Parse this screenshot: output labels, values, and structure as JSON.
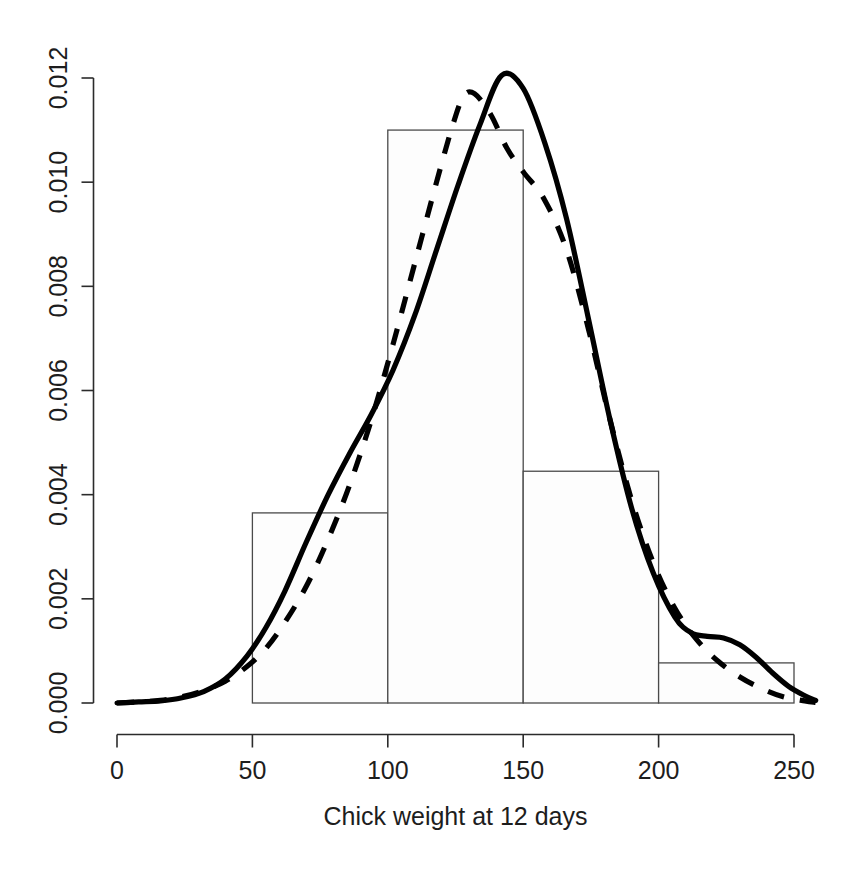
{
  "chart_data": {
    "type": "histogram",
    "title": "",
    "subtitle": "",
    "xlabel": "Chick weight at 12 days",
    "ylabel": "",
    "xlim": [
      0,
      255
    ],
    "ylim": [
      0.0,
      0.0125
    ],
    "grid": false,
    "legend": "none",
    "x_ticks": [
      0,
      50,
      100,
      150,
      200,
      250
    ],
    "x_tick_labels": [
      "0",
      "50",
      "100",
      "150",
      "200",
      "250"
    ],
    "y_ticks": [
      0.0,
      0.002,
      0.004,
      0.006,
      0.008,
      0.01,
      0.012
    ],
    "y_tick_labels": [
      "0.000",
      "0.002",
      "0.004",
      "0.006",
      "0.008",
      "0.010",
      "0.012"
    ],
    "y_tick_label_rotation": 90,
    "histogram": {
      "bin_width": 50,
      "bin_edges": [
        50,
        100,
        150,
        200,
        250
      ],
      "bins": [
        {
          "from": 50,
          "to": 100,
          "density": 0.00365
        },
        {
          "from": 100,
          "to": 150,
          "density": 0.011
        },
        {
          "from": 150,
          "to": 200,
          "density": 0.00445
        },
        {
          "from": 200,
          "to": 250,
          "density": 0.00077
        }
      ],
      "fill_color": "#fdfdfd",
      "border_color": "#4a4a4a"
    },
    "series": [
      {
        "name": "density-curve-solid",
        "style": "solid",
        "color": "#000000",
        "line_width": 5.2,
        "points": [
          [
            0,
            0.0
          ],
          [
            8,
            2e-05
          ],
          [
            16,
            4e-05
          ],
          [
            24,
            0.0001
          ],
          [
            32,
            0.00022
          ],
          [
            40,
            0.00046
          ],
          [
            48,
            0.0009
          ],
          [
            55,
            0.00145
          ],
          [
            62,
            0.00215
          ],
          [
            70,
            0.0031
          ],
          [
            78,
            0.004
          ],
          [
            86,
            0.0048
          ],
          [
            94,
            0.00555
          ],
          [
            102,
            0.0064
          ],
          [
            110,
            0.00745
          ],
          [
            118,
            0.0087
          ],
          [
            126,
            0.00995
          ],
          [
            134,
            0.0111
          ],
          [
            142,
            0.01205
          ],
          [
            150,
            0.0118
          ],
          [
            158,
            0.01075
          ],
          [
            166,
            0.0093
          ],
          [
            174,
            0.0074
          ],
          [
            182,
            0.00545
          ],
          [
            190,
            0.00375
          ],
          [
            198,
            0.0025
          ],
          [
            206,
            0.00165
          ],
          [
            212,
            0.00135
          ],
          [
            218,
            0.00128
          ],
          [
            224,
            0.00125
          ],
          [
            230,
            0.00112
          ],
          [
            236,
            0.00088
          ],
          [
            242,
            0.00058
          ],
          [
            248,
            0.00032
          ],
          [
            254,
            0.00014
          ],
          [
            258,
            5e-05
          ]
        ]
      },
      {
        "name": "density-curve-dashed",
        "style": "dashed",
        "color": "#000000",
        "line_width": 5.2,
        "dash_pattern": "17 16",
        "points": [
          [
            0,
            0.0
          ],
          [
            8,
            2e-05
          ],
          [
            16,
            5e-05
          ],
          [
            24,
            0.00012
          ],
          [
            32,
            0.00024
          ],
          [
            40,
            0.00042
          ],
          [
            48,
            0.0007
          ],
          [
            55,
            0.00105
          ],
          [
            62,
            0.00155
          ],
          [
            70,
            0.00225
          ],
          [
            78,
            0.00315
          ],
          [
            86,
            0.0042
          ],
          [
            94,
            0.00545
          ],
          [
            102,
            0.0069
          ],
          [
            110,
            0.00845
          ],
          [
            118,
            0.01
          ],
          [
            124,
            0.0111
          ],
          [
            128,
            0.01165
          ],
          [
            132,
            0.0117
          ],
          [
            138,
            0.0113
          ],
          [
            144,
            0.01065
          ],
          [
            150,
            0.0102
          ],
          [
            158,
            0.00965
          ],
          [
            166,
            0.0087
          ],
          [
            174,
            0.0072
          ],
          [
            182,
            0.00545
          ],
          [
            190,
            0.0039
          ],
          [
            198,
            0.0027
          ],
          [
            206,
            0.00182
          ],
          [
            214,
            0.00122
          ],
          [
            222,
            0.0008
          ],
          [
            230,
            0.0005
          ],
          [
            238,
            0.00028
          ],
          [
            246,
            0.00012
          ],
          [
            254,
            4e-05
          ],
          [
            258,
            1e-05
          ]
        ]
      }
    ]
  },
  "axis": {
    "x_title": "Chick weight at 12 days"
  }
}
